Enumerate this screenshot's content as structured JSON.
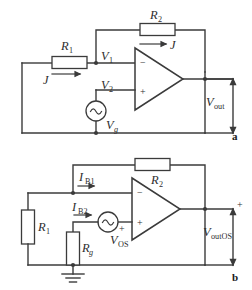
{
  "figure": {
    "panels": [
      {
        "id": "a",
        "label": "a",
        "caption": "Inverting amplifier with signal source",
        "components": {
          "r1": "R",
          "r1_sub": "1",
          "r2": "R",
          "r2_sub": "2",
          "current_in": "J",
          "current_fb": "J",
          "node_v1": "V",
          "node_v1_sub": "1",
          "node_v2": "V",
          "node_v2_sub": "2",
          "source": "V",
          "source_sub": "g",
          "output": "V",
          "output_sub": "out",
          "opamp_minus": "−",
          "opamp_plus": "+"
        }
      },
      {
        "id": "b",
        "label": "b",
        "caption": "Offset model with bias currents and input offset voltage",
        "components": {
          "r1": "R",
          "r1_sub": "1",
          "r2": "R",
          "r2_sub": "2",
          "rg": "R",
          "rg_sub": "g",
          "ib1": "I",
          "ib1_sub": "B1",
          "ib2": "I",
          "ib2_sub": "B2",
          "vos": "V",
          "vos_sub": "OS",
          "vos_polarity": "+",
          "output": "V",
          "output_sub": "outOS",
          "output_polarity": "+",
          "opamp_minus": "−",
          "opamp_plus": "+",
          "ground": "ground-symbol"
        }
      }
    ],
    "colors": {
      "line": "#3b3b3b",
      "text": "#2e2e2e",
      "background": "#ffffff"
    }
  }
}
